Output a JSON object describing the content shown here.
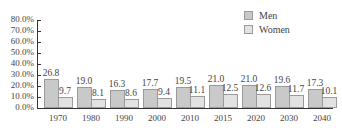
{
  "chart_data": {
    "type": "bar",
    "title": "",
    "xlabel": "",
    "ylabel": "",
    "categories": [
      "1970",
      "1980",
      "1990",
      "2000",
      "2010",
      "2015",
      "2020",
      "2030",
      "2040"
    ],
    "series": [
      {
        "name": "Men",
        "values": [
          26.8,
          19.0,
          16.3,
          17.7,
          19.5,
          21.0,
          21.0,
          19.6,
          17.3
        ],
        "color": "#c9c9c9"
      },
      {
        "name": "Women",
        "values": [
          9.7,
          8.1,
          8.6,
          9.4,
          11.1,
          12.5,
          12.6,
          11.7,
          10.1
        ],
        "color": "#e2e2e2"
      }
    ],
    "value_labels": {
      "Men": [
        "26.8",
        "19.0",
        "16.3",
        "17.7",
        "19.5",
        "21.0",
        "21.0",
        "19.6",
        "17.3"
      ],
      "Women": [
        "9.7",
        "8.1",
        "8.6",
        "9.4",
        "11.1",
        "12.5",
        "12.6",
        "11.7",
        "10.1"
      ]
    },
    "ylim": [
      0,
      80
    ],
    "yticks": [
      "0.0%",
      "10.0%",
      "20.0%",
      "30.0%",
      "40.0%",
      "50.0%",
      "60.0%",
      "70.0%",
      "80.0%"
    ],
    "grid": false,
    "legend_position": "top-right"
  },
  "legend": {
    "men_label": "Men",
    "women_label": "Women"
  }
}
